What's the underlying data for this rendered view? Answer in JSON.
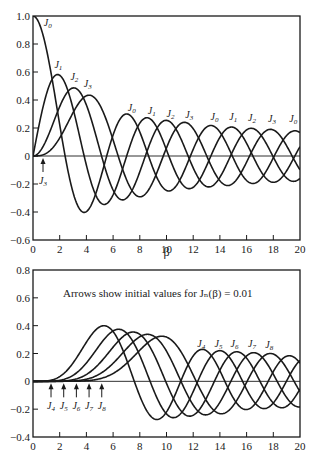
{
  "chart_data": [
    {
      "type": "line",
      "title": "",
      "xlabel": "β",
      "ylabel": "",
      "xlim": [
        0,
        20
      ],
      "ylim": [
        -0.6,
        1.0
      ],
      "xticks": [
        "0",
        "2",
        "4",
        "6",
        "8",
        "10",
        "12",
        "14",
        "16",
        "18",
        "20"
      ],
      "yticks": [
        "1.0",
        "0.8",
        "0.6",
        "0.4",
        "0.2",
        "0",
        "-0.2",
        "-0.4",
        "-0.6"
      ],
      "grid": false,
      "series": [
        {
          "name": "J0",
          "order": 0
        },
        {
          "name": "J1",
          "order": 1
        },
        {
          "name": "J2",
          "order": 2
        },
        {
          "name": "J3",
          "order": 3
        }
      ],
      "peaks": [
        {
          "name": "J0",
          "x": 0,
          "y": 1.0
        },
        {
          "name": "J1",
          "x": 1.84,
          "y": 0.58
        },
        {
          "name": "J2",
          "x": 3.05,
          "y": 0.49
        },
        {
          "name": "J3",
          "x": 4.2,
          "y": 0.43
        }
      ],
      "curve_labels": [
        {
          "text": "J",
          "sub": "0",
          "x": 1.1,
          "y": 0.93
        },
        {
          "text": "J",
          "sub": "1",
          "x": 1.9,
          "y": 0.63
        },
        {
          "text": "J",
          "sub": "2",
          "x": 3.1,
          "y": 0.54
        },
        {
          "text": "J",
          "sub": "3",
          "x": 4.1,
          "y": 0.49
        },
        {
          "text": "J",
          "sub": "0",
          "x": 7.4,
          "y": 0.32
        },
        {
          "text": "J",
          "sub": "1",
          "x": 8.9,
          "y": 0.3
        },
        {
          "text": "J",
          "sub": "2",
          "x": 10.3,
          "y": 0.28
        },
        {
          "text": "J",
          "sub": "3",
          "x": 11.7,
          "y": 0.27
        },
        {
          "text": "J",
          "sub": "0",
          "x": 13.6,
          "y": 0.26
        },
        {
          "text": "J",
          "sub": "1",
          "x": 15.0,
          "y": 0.26
        },
        {
          "text": "J",
          "sub": "2",
          "x": 16.4,
          "y": 0.25
        },
        {
          "text": "J",
          "sub": "3",
          "x": 17.9,
          "y": 0.24
        },
        {
          "text": "J",
          "sub": "0",
          "x": 19.5,
          "y": 0.24
        }
      ],
      "arrows": [
        {
          "label": "J",
          "sub": "3",
          "x": 0.75
        }
      ]
    },
    {
      "type": "line",
      "title": "",
      "xlabel": "",
      "ylabel": "",
      "xlim": [
        0,
        20
      ],
      "ylim": [
        -0.4,
        0.8
      ],
      "xticks": [
        "0",
        "2",
        "4",
        "6",
        "8",
        "10",
        "12",
        "14",
        "16",
        "18",
        "20"
      ],
      "yticks": [
        "0.8",
        "0.6",
        "0.4",
        "0.2",
        "0",
        "-0.2",
        "-0.4"
      ],
      "grid": false,
      "annotation": "Arrows show initial values for Jₙ(β) = 0.01",
      "series": [
        {
          "name": "J4",
          "order": 4
        },
        {
          "name": "J5",
          "order": 5
        },
        {
          "name": "J6",
          "order": 6
        },
        {
          "name": "J7",
          "order": 7
        },
        {
          "name": "J8",
          "order": 8
        }
      ],
      "peaks": [
        {
          "name": "J4",
          "x": 5.32,
          "y": 0.4
        },
        {
          "name": "J5",
          "x": 6.42,
          "y": 0.37
        },
        {
          "name": "J6",
          "x": 7.5,
          "y": 0.35
        },
        {
          "name": "J7",
          "x": 8.58,
          "y": 0.33
        },
        {
          "name": "J8",
          "x": 9.65,
          "y": 0.32
        }
      ],
      "curve_labels": [
        {
          "text": "J",
          "sub": "4",
          "x": 12.6,
          "y": 0.25
        },
        {
          "text": "J",
          "sub": "5",
          "x": 13.9,
          "y": 0.25
        },
        {
          "text": "J",
          "sub": "6",
          "x": 15.1,
          "y": 0.25
        },
        {
          "text": "J",
          "sub": "7",
          "x": 16.4,
          "y": 0.25
        },
        {
          "text": "J",
          "sub": "8",
          "x": 17.7,
          "y": 0.24
        }
      ],
      "arrows": [
        {
          "label": "J",
          "sub": "4",
          "x": 1.35
        },
        {
          "label": "J",
          "sub": "5",
          "x": 2.3
        },
        {
          "label": "J",
          "sub": "6",
          "x": 3.25
        },
        {
          "label": "J",
          "sub": "7",
          "x": 4.2
        },
        {
          "label": "J",
          "sub": "8",
          "x": 5.15
        }
      ]
    }
  ],
  "colors": {
    "line": "#1a1a1a",
    "background": "#ffffff"
  }
}
